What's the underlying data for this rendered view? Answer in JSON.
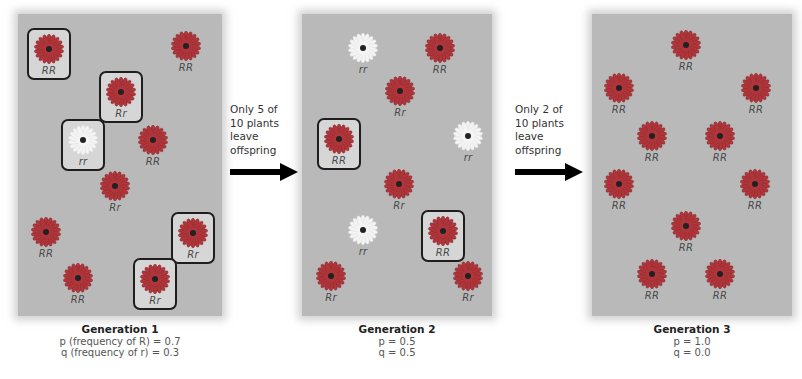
{
  "colors": {
    "panel_bg": "#b9b9b9",
    "red_flower": "#b0353a",
    "red_flower_dark": "#7e2a2c",
    "white_flower": "#f4f4f4",
    "flower_center": "#222222",
    "box_border": "#1e1e1e",
    "arrow": "#000000"
  },
  "generations": [
    {
      "title": "Generation 1",
      "p_line": "p (frequency of R) = 0.7",
      "q_line": "q (frequency of r) = 0.3",
      "plants": [
        {
          "genotype": "RR",
          "color": "red",
          "boxed": true,
          "x": 27,
          "y": 28
        },
        {
          "genotype": "RR",
          "color": "red",
          "boxed": false,
          "x": 164,
          "y": 28
        },
        {
          "genotype": "Rr",
          "color": "red",
          "boxed": true,
          "x": 99,
          "y": 71
        },
        {
          "genotype": "rr",
          "color": "white",
          "boxed": true,
          "x": 61,
          "y": 119
        },
        {
          "genotype": "RR",
          "color": "red",
          "boxed": false,
          "x": 131,
          "y": 122
        },
        {
          "genotype": "Rr",
          "color": "red",
          "boxed": false,
          "x": 93,
          "y": 168
        },
        {
          "genotype": "RR",
          "color": "red",
          "boxed": false,
          "x": 24,
          "y": 214
        },
        {
          "genotype": "Rr",
          "color": "red",
          "boxed": true,
          "x": 171,
          "y": 212
        },
        {
          "genotype": "RR",
          "color": "red",
          "boxed": false,
          "x": 56,
          "y": 260
        },
        {
          "genotype": "Rr",
          "color": "red",
          "boxed": true,
          "x": 133,
          "y": 258
        }
      ]
    },
    {
      "title": "Generation 2",
      "p_line": "p = 0.5",
      "q_line": "q = 0.5",
      "plants": [
        {
          "genotype": "rr",
          "color": "white",
          "boxed": false,
          "x": 341,
          "y": 30
        },
        {
          "genotype": "RR",
          "color": "red",
          "boxed": false,
          "x": 418,
          "y": 30
        },
        {
          "genotype": "Rr",
          "color": "red",
          "boxed": false,
          "x": 378,
          "y": 73
        },
        {
          "genotype": "RR",
          "color": "red",
          "boxed": true,
          "x": 317,
          "y": 118
        },
        {
          "genotype": "rr",
          "color": "white",
          "boxed": false,
          "x": 446,
          "y": 118
        },
        {
          "genotype": "Rr",
          "color": "red",
          "boxed": false,
          "x": 377,
          "y": 166
        },
        {
          "genotype": "rr",
          "color": "white",
          "boxed": false,
          "x": 341,
          "y": 212
        },
        {
          "genotype": "RR",
          "color": "red",
          "boxed": true,
          "x": 421,
          "y": 210
        },
        {
          "genotype": "Rr",
          "color": "red",
          "boxed": false,
          "x": 309,
          "y": 258
        },
        {
          "genotype": "Rr",
          "color": "red",
          "boxed": false,
          "x": 446,
          "y": 258
        }
      ]
    },
    {
      "title": "Generation 3",
      "p_line": "p = 1.0",
      "q_line": "q = 0.0",
      "plants": [
        {
          "genotype": "RR",
          "color": "red",
          "boxed": false,
          "x": 664,
          "y": 27
        },
        {
          "genotype": "RR",
          "color": "red",
          "boxed": false,
          "x": 597,
          "y": 70
        },
        {
          "genotype": "RR",
          "color": "red",
          "boxed": false,
          "x": 734,
          "y": 70
        },
        {
          "genotype": "RR",
          "color": "red",
          "boxed": false,
          "x": 630,
          "y": 118
        },
        {
          "genotype": "RR",
          "color": "red",
          "boxed": false,
          "x": 698,
          "y": 118
        },
        {
          "genotype": "RR",
          "color": "red",
          "boxed": false,
          "x": 597,
          "y": 166
        },
        {
          "genotype": "RR",
          "color": "red",
          "boxed": false,
          "x": 733,
          "y": 166
        },
        {
          "genotype": "RR",
          "color": "red",
          "boxed": false,
          "x": 664,
          "y": 208
        },
        {
          "genotype": "RR",
          "color": "red",
          "boxed": false,
          "x": 630,
          "y": 256
        },
        {
          "genotype": "RR",
          "color": "red",
          "boxed": false,
          "x": 698,
          "y": 256
        }
      ]
    }
  ],
  "transitions": [
    {
      "lines": [
        "Only 5 of",
        "10 plants",
        "leave",
        "offspring"
      ]
    },
    {
      "lines": [
        "Only 2 of",
        "10 plants",
        "leave",
        "offspring"
      ]
    }
  ]
}
